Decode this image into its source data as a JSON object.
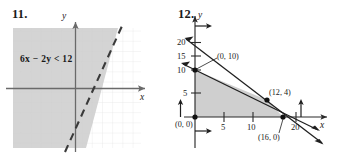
{
  "page": {
    "width": 337,
    "height": 160,
    "background": "#ffffff",
    "ink": "#1a1a1a",
    "shade_fill": "#d2d2d2",
    "grid_color": "#cfcfcf"
  },
  "figures": [
    {
      "number": "11.",
      "type": "linear-inequality-graph",
      "inequality": {
        "coef_x": "6x",
        "operator_minus": "−",
        "coef_y": "2y",
        "relation": "<",
        "constant": "12",
        "full": "6x − 2y < 12"
      },
      "axes": {
        "x_label": "x",
        "y_label": "y"
      },
      "boundary": {
        "style": "dashed",
        "equation": "6x - 2y = 12",
        "slope": 3,
        "intercept": -6
      },
      "shading": {
        "side": "left",
        "description": "region left of dashed boundary line is shaded gray"
      },
      "grid": {
        "visible": true,
        "spacing": 10
      }
    },
    {
      "number": "12.",
      "type": "feasible-region-graph",
      "axes": {
        "x_label": "x",
        "y_label": "y"
      },
      "y_ticks": [
        "20",
        "15",
        "10",
        "5"
      ],
      "x_ticks": [
        "5",
        "10",
        "20"
      ],
      "vertices": [
        {
          "label": "(0, 10)"
        },
        {
          "label": "(12, 4)"
        },
        {
          "label": "(16, 0)"
        },
        {
          "label": "(0, 0)"
        }
      ],
      "shading": {
        "description": "quadrilateral feasible region shaded gray"
      },
      "constraint_arrows": 4
    }
  ]
}
